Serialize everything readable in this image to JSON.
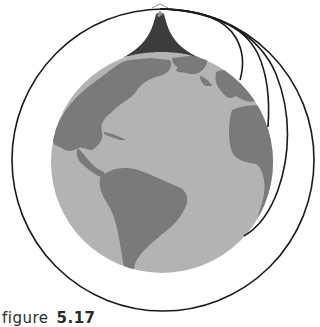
{
  "figure": {
    "caption_label": "figure",
    "caption_number": "5.17",
    "colors": {
      "background": "#ffffff",
      "ocean": "#b3b3b3",
      "land": "#7a7a7a",
      "mountain": "#3c3c3c",
      "mountain_snow": "#9a9a9a",
      "trajectory": "#1a1a1a"
    },
    "earth": {
      "cx": 162,
      "cy": 162,
      "r": 111
    },
    "mountain": {
      "peak_x": 160,
      "peak_y": 8
    },
    "trajectories": [
      {
        "name": "short-fall",
        "landing": "near north Africa / Europe"
      },
      {
        "name": "medium-fall",
        "landing": "west Africa"
      },
      {
        "name": "long-fall",
        "landing": "south Atlantic"
      },
      {
        "name": "full-orbit",
        "landing": "none - circles Earth"
      }
    ]
  }
}
